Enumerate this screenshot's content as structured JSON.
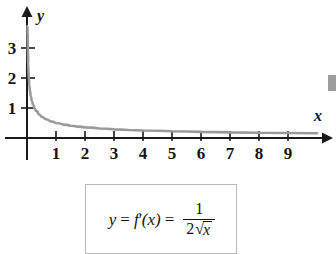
{
  "figure": {
    "axis_labels": {
      "x": "x",
      "y": "y"
    },
    "x_ticks": [
      "1",
      "2",
      "3",
      "4",
      "5",
      "6",
      "7",
      "8",
      "9"
    ],
    "y_ticks": [
      "1",
      "2",
      "3"
    ],
    "colors": {
      "curve": "#9a9a9a",
      "axis": "#1a1a1a",
      "box_border": "#b9b9b9",
      "text": "#141414",
      "background": "#ffffff"
    }
  },
  "formula": {
    "lhs_y": "y",
    "equals_1": "=",
    "f": "f",
    "prime": "′",
    "arg": "(x)",
    "equals_2": "=",
    "numerator": "1",
    "denominator_coefficient": "2",
    "radical_sign": "√",
    "radicand": "x",
    "plain_text": "y = f′(x) = 1/(2√x)"
  },
  "chart_data": {
    "type": "line",
    "title": "",
    "xlabel": "x",
    "ylabel": "y",
    "xlim": [
      0,
      10.4
    ],
    "ylim": [
      0,
      3.9
    ],
    "grid": false,
    "legend": "none",
    "xticks": [
      1,
      2,
      3,
      4,
      5,
      6,
      7,
      8,
      9
    ],
    "yticks": [
      1,
      2,
      3
    ],
    "series": [
      {
        "name": "y = f'(x) = 1/(2√x)",
        "color": "#9a9a9a",
        "x": [
          0.018,
          0.02,
          0.025,
          0.03,
          0.04,
          0.05,
          0.0625,
          0.08,
          0.1,
          0.125,
          0.16,
          0.2,
          0.25,
          0.3,
          0.4,
          0.5,
          0.625,
          0.8,
          1.0,
          1.25,
          1.5,
          1.75,
          2.0,
          2.5,
          3.0,
          3.5,
          4.0,
          5.0,
          6.0,
          7.0,
          8.0,
          9.0,
          10.0
        ],
        "y": [
          3.73,
          3.54,
          3.16,
          2.89,
          2.5,
          2.24,
          2.0,
          1.77,
          1.58,
          1.41,
          1.25,
          1.12,
          1.0,
          0.913,
          0.791,
          0.707,
          0.632,
          0.559,
          0.5,
          0.447,
          0.408,
          0.378,
          0.354,
          0.316,
          0.289,
          0.267,
          0.25,
          0.224,
          0.204,
          0.189,
          0.177,
          0.167,
          0.158
        ]
      }
    ],
    "annotations": [
      {
        "text": "y = f′(x) = 1/(2√x)",
        "type": "boxed-caption"
      }
    ]
  }
}
